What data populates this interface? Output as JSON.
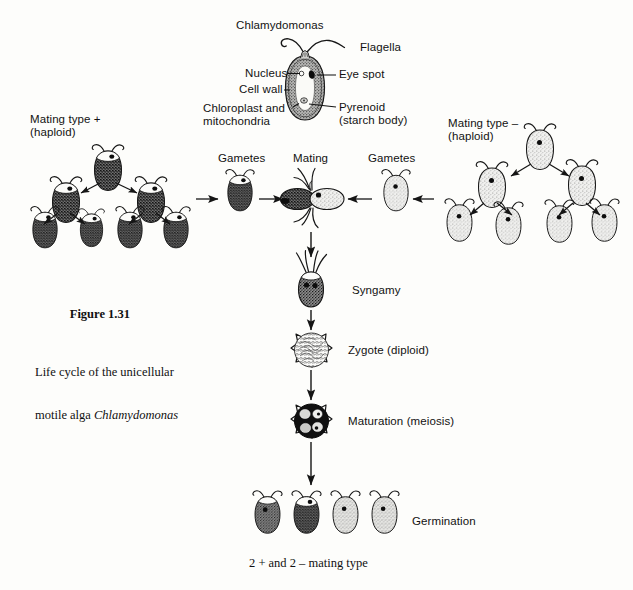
{
  "figure": {
    "organism_title": "Chlamydomonas",
    "caption_title": "Figure 1.31",
    "caption_line1": "Life cycle of the unicellular",
    "caption_line2_prefix": "motile alga ",
    "caption_line2_italic": "Chlamydomonas"
  },
  "anatomy_labels": {
    "flagella": "Flagella",
    "eye_spot": "Eye spot",
    "nucleus": "Nucleus",
    "cell_wall": "Cell wall",
    "chloroplast_line1": "Chloroplast and",
    "chloroplast_line2": "mitochondria",
    "pyrenoid_line1": "Pyrenoid",
    "pyrenoid_line2": "(starch body)"
  },
  "cycle_labels": {
    "mating_type_plus_line1": "Mating type +",
    "mating_type_plus_line2": "(haploid)",
    "mating_type_minus_line1": "Mating type –",
    "mating_type_minus_line2": "(haploid)",
    "gametes_left": "Gametes",
    "gametes_right": "Gametes",
    "mating": "Mating",
    "syngamy": "Syngamy",
    "zygote": "Zygote (diploid)",
    "maturation": "Maturation (meiosis)",
    "germination": "Germination",
    "mating_type_result": "2 + and 2 – mating type"
  },
  "colors": {
    "ink": "#151515",
    "background": "#fdfdfb",
    "dark_cell": "#5a5a5a",
    "light_cell": "#e2e2e2",
    "zygote_dark": "#101010"
  },
  "icons": {
    "arrow": "arrow-icon",
    "cell": "algal-cell-icon",
    "zygote": "zygote-cell-icon"
  }
}
